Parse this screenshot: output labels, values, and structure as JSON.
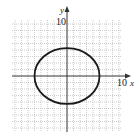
{
  "chart_data": {
    "type": "line",
    "title": "",
    "xlabel": "x",
    "ylabel": "y",
    "x_tick_label": "10",
    "y_tick_label": "10",
    "xlim": [
      -10,
      10
    ],
    "ylim": [
      -10,
      10
    ],
    "grid": true,
    "series": [
      {
        "name": "ellipse",
        "shape": "ellipse",
        "center": [
          0,
          0
        ],
        "semi_axis_x": 5,
        "semi_axis_y": 4.3,
        "color": "#1a1a1a"
      }
    ]
  },
  "labels": {
    "x_axis": "x",
    "y_axis": "y",
    "x_max": "10",
    "y_max": "10"
  },
  "colors": {
    "grid": "#b8b8b8",
    "axis": "#333333",
    "curve": "#1a1a1a"
  }
}
